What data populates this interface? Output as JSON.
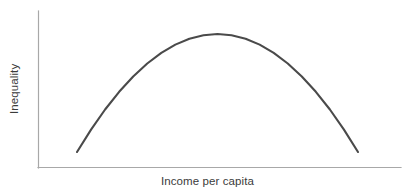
{
  "chart_data": {
    "type": "line",
    "title": "",
    "subtitle": "",
    "xlabel": "Income per capita",
    "ylabel": "Inequality",
    "x": [
      0,
      0.05,
      0.1,
      0.15,
      0.2,
      0.25,
      0.3,
      0.35,
      0.4,
      0.45,
      0.5,
      0.55,
      0.6,
      0.65,
      0.7,
      0.75,
      0.8,
      0.85,
      0.9,
      0.95,
      1.0
    ],
    "series": [
      {
        "name": "Kuznets curve",
        "color": "#4a4a4a",
        "values": [
          0.0,
          0.19,
          0.36,
          0.51,
          0.64,
          0.75,
          0.84,
          0.91,
          0.96,
          0.99,
          1.0,
          0.99,
          0.96,
          0.91,
          0.84,
          0.75,
          0.64,
          0.51,
          0.36,
          0.19,
          0.0
        ]
      }
    ],
    "xlim": [
      0,
      1
    ],
    "ylim": [
      0,
      1
    ],
    "xticks": [],
    "yticks": [],
    "xticklabels": [],
    "yticklabels": [],
    "grid": false,
    "legend": false,
    "annotations": [],
    "axis_color": "#a8a8a8",
    "background_color": "#ffffff",
    "peak": {
      "x": 0.5,
      "y": 1.0
    }
  },
  "labels": {
    "x_axis": "Income per capita",
    "y_axis": "Inequality"
  }
}
